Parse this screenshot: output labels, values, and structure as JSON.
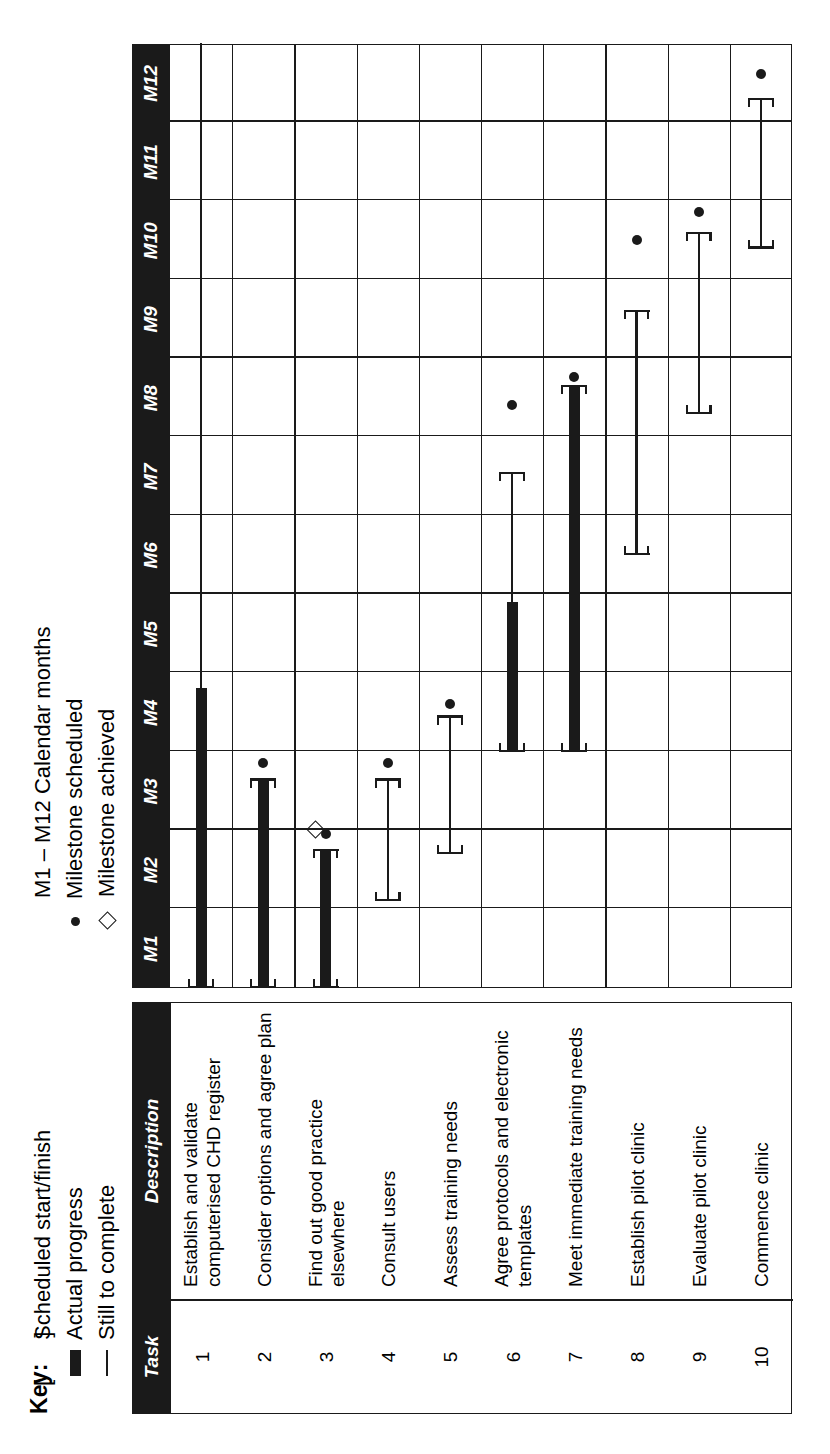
{
  "key": {
    "title": "Key:",
    "left_entries": [
      {
        "symbol": "bracket-pair",
        "label": "Scheduled start/finish"
      },
      {
        "symbol": "thick-bar",
        "label": "Actual progress"
      },
      {
        "symbol": "thin-line",
        "label": "Still to complete"
      }
    ],
    "right_entries": [
      {
        "symbol": "none",
        "label": "M1 – M12 Calendar months"
      },
      {
        "symbol": "dot",
        "label": "Milestone scheduled"
      },
      {
        "symbol": "diamond",
        "label": "Milestone achieved"
      }
    ]
  },
  "table": {
    "headers": {
      "number": "Task number",
      "description": "Description"
    },
    "rows": [
      {
        "number": "1",
        "description": "Establish and validate computerised CHD register"
      },
      {
        "number": "2",
        "description": "Consider options and agree plan"
      },
      {
        "number": "3",
        "description": "Find out good practice elsewhere"
      },
      {
        "number": "4",
        "description": "Consult users"
      },
      {
        "number": "5",
        "description": "Assess training needs"
      },
      {
        "number": "6",
        "description": "Agree protocols and electronic templates"
      },
      {
        "number": "7",
        "description": "Meet immediate training needs"
      },
      {
        "number": "8",
        "description": "Establish pilot clinic"
      },
      {
        "number": "9",
        "description": "Evaluate pilot clinic"
      },
      {
        "number": "10",
        "description": "Commence clinic"
      }
    ]
  },
  "chart_data": {
    "type": "bar",
    "xlabel": "Calendar months",
    "ylabel": "Task number",
    "categories": [
      "M1",
      "M2",
      "M3",
      "M4",
      "M5",
      "M6",
      "M7",
      "M8",
      "M9",
      "M10",
      "M11",
      "M12"
    ],
    "xlim": [
      0,
      12
    ],
    "grid": true,
    "legend_position": "top",
    "tasks": [
      {
        "id": 1,
        "name": "Establish and validate computerised CHD register",
        "start": 0.0,
        "end": 12.0,
        "actual_end": 3.8,
        "milestone_scheduled": null,
        "milestone_achieved": null,
        "bracket_start": true,
        "bracket_end": false
      },
      {
        "id": 2,
        "name": "Consider options and agree plan",
        "start": 0.0,
        "end": 2.65,
        "actual_end": 2.65,
        "milestone_scheduled": 2.85,
        "milestone_achieved": null,
        "bracket_start": true,
        "bracket_end": true
      },
      {
        "id": 3,
        "name": "Find out good practice elsewhere",
        "start": 0.0,
        "end": 1.75,
        "actual_end": 1.75,
        "milestone_scheduled": 1.95,
        "milestone_achieved": 2.0,
        "bracket_start": true,
        "bracket_end": true
      },
      {
        "id": 4,
        "name": "Consult users",
        "start": 1.1,
        "end": 2.65,
        "actual_end": 1.1,
        "milestone_scheduled": 2.85,
        "milestone_achieved": null,
        "bracket_start": true,
        "bracket_end": true
      },
      {
        "id": 5,
        "name": "Assess training needs",
        "start": 1.7,
        "end": 3.45,
        "actual_end": 1.7,
        "milestone_scheduled": 3.6,
        "milestone_achieved": null,
        "bracket_start": true,
        "bracket_end": true
      },
      {
        "id": 6,
        "name": "Agree protocols and electronic templates",
        "start": 3.0,
        "end": 6.55,
        "actual_end": 4.9,
        "milestone_scheduled": 7.4,
        "milestone_achieved": null,
        "bracket_start": true,
        "bracket_end": true
      },
      {
        "id": 7,
        "name": "Meet immediate training needs",
        "start": 3.0,
        "end": 7.65,
        "actual_end": 7.65,
        "milestone_scheduled": 7.75,
        "milestone_achieved": null,
        "bracket_start": true,
        "bracket_end": true
      },
      {
        "id": 8,
        "name": "Establish pilot clinic",
        "start": 5.5,
        "end": 8.6,
        "actual_end": 5.5,
        "milestone_scheduled": 9.5,
        "milestone_achieved": null,
        "bracket_start": true,
        "bracket_end": true
      },
      {
        "id": 9,
        "name": "Evaluate pilot clinic",
        "start": 7.3,
        "end": 9.6,
        "actual_end": 7.3,
        "milestone_scheduled": 9.85,
        "milestone_achieved": null,
        "bracket_start": true,
        "bracket_end": true
      },
      {
        "id": 10,
        "name": "Commence clinic",
        "start": 9.4,
        "end": 11.3,
        "actual_end": 9.4,
        "milestone_scheduled": 11.6,
        "milestone_achieved": null,
        "bracket_start": true,
        "bracket_end": true
      }
    ]
  }
}
